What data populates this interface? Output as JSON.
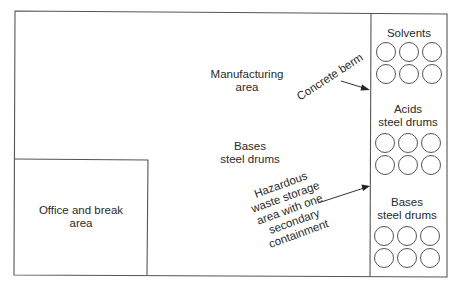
{
  "diagram": {
    "type": "floor-plan",
    "areas": {
      "manufacturing": {
        "line1": "Manufacturing",
        "line2": "area"
      },
      "bases_floor": {
        "line1": "Bases",
        "line2": "steel drums"
      },
      "office": {
        "line1": "Office and break",
        "line2": "area"
      }
    },
    "storage_column": {
      "sections": [
        {
          "id": "solvents",
          "line1": "Solvents",
          "line2": "",
          "drum_count": 6
        },
        {
          "id": "acids",
          "line1": "Acids",
          "line2": "steel drums",
          "drum_count": 6
        },
        {
          "id": "bases",
          "line1": "Bases",
          "line2": "steel drums",
          "drum_count": 6
        }
      ]
    },
    "callouts": {
      "berm": {
        "text": "Concrete berm"
      },
      "hazardous": {
        "line1": "Hazardous",
        "line2": "waste storage",
        "line3": "area with one",
        "line4": "secondary",
        "line5": "containment"
      }
    },
    "colors": {
      "line": "#555555",
      "text": "#2a2a2a",
      "background": "#ffffff"
    }
  }
}
